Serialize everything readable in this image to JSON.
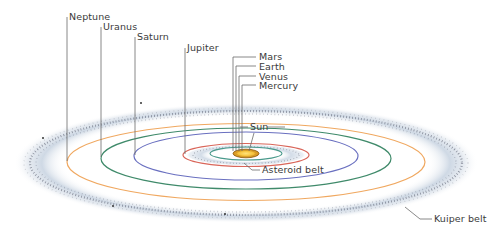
{
  "diagram": {
    "colors": {
      "background": "#ffffff",
      "leader_line": "#6b6b6b",
      "label_text": "#3a3a3a",
      "neptune_orbit": "#f0a860",
      "uranus_orbit": "#3f8a6a",
      "saturn_orbit": "#6a70c0",
      "jupiter_orbit": "#d9665a",
      "mars_orbit": "#4a9a8c",
      "sun_core": "#f6c23a",
      "sun_rim": "#8a5a10",
      "belt_haze": "#c6d2e0",
      "belt_dots": "#4a4f5a"
    },
    "labels": {
      "neptune": "Neptune",
      "uranus": "Uranus",
      "saturn": "Saturn",
      "jupiter": "Jupiter",
      "mars": "Mars",
      "earth": "Earth",
      "venus": "Venus",
      "mercury": "Mercury",
      "sun": "Sun",
      "asteroid_belt": "Asteroid belt",
      "kuiper_belt": "Kuiper belt"
    }
  }
}
